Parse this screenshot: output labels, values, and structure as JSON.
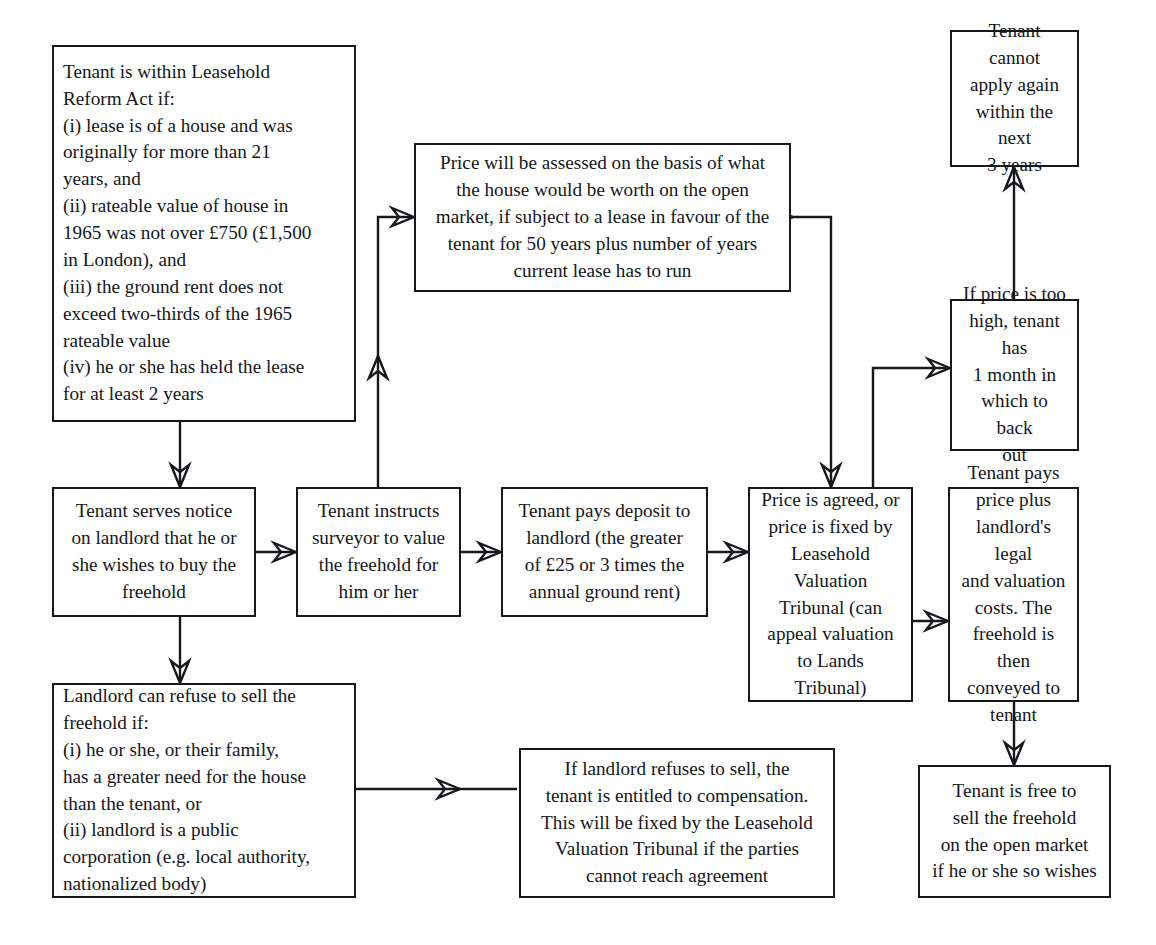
{
  "diagram": {
    "background_color": "#ffffff",
    "line_color": "#16181c",
    "box_border_color": "#16181c",
    "nodes": {
      "eligibility": "Tenant is within Leasehold\nReform Act if:\n(i) lease is of a house and was\noriginally for more than 21\nyears, and\n(ii) rateable value of house in\n1965 was not over £750 (£1,500\nin London), and\n(iii) the ground rent does not\nexceed two-thirds of the 1965\nrateable value\n(iv) he or she has held the lease\nfor at least 2 years",
      "price_basis": "Price will be assessed on the basis of what\nthe house would be worth on the open\nmarket, if subject to a lease in favour of the\ntenant for 50 years plus number of years\ncurrent lease has to run",
      "cannot_apply": "Tenant cannot\napply again\nwithin the next\n3 years",
      "price_too_high": "If price is too\nhigh, tenant has\n1 month in\nwhich to back\nout",
      "serves_notice": "Tenant serves notice\non landlord that he or\nshe wishes to buy the\nfreehold",
      "instructs_surveyor": "Tenant instructs\nsurveyor to value\nthe freehold for\nhim or her",
      "pays_deposit": "Tenant pays deposit to\nlandlord (the greater\nof £25 or 3 times the\nannual ground rent)",
      "price_agreed": "Price is agreed, or\nprice is fixed by\nLeasehold\nValuation\nTribunal (can\nappeal valuation\nto Lands\nTribunal)",
      "tenant_pays_price": "Tenant pays\nprice plus\nlandlord's legal\nand valuation\ncosts. The\nfreehold is then\nconveyed to\ntenant",
      "landlord_refuse": "Landlord can refuse to sell the\nfreehold if:\n(i) he or she, or their family,\nhas a greater need for the house\nthan the tenant, or\n(ii) landlord is a public\ncorporation (e.g. local authority,\nnationalized body)",
      "compensation": "If landlord refuses to sell, the\ntenant is entitled to compensation.\nThis will be fixed by the Leasehold\nValuation Tribunal if the parties\ncannot reach agreement",
      "free_to_sell": "Tenant is free to\nsell the freehold\non the open market\nif he or she so wishes"
    }
  }
}
